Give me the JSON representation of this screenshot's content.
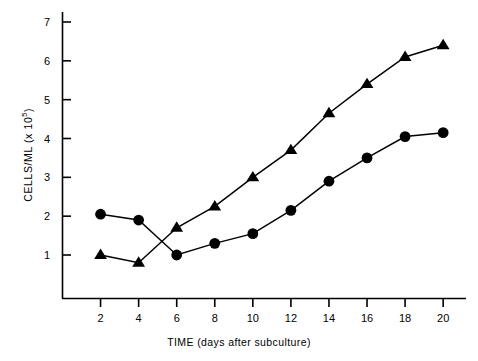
{
  "chart_data": {
    "type": "line",
    "title": "",
    "xlabel": "TIME (days after subculture)",
    "ylabel": "CELLS/ML (x 10⁵)",
    "ylabel_base": "CELLS/ML (x 10",
    "ylabel_exponent": "5",
    "ylabel_close": ")",
    "x": [
      2,
      4,
      6,
      8,
      10,
      12,
      14,
      16,
      18,
      20
    ],
    "xlim": [
      0,
      21.2
    ],
    "ylim": [
      0,
      7.6
    ],
    "xticks": [
      2,
      4,
      6,
      8,
      10,
      12,
      14,
      16,
      18,
      20
    ],
    "yticks": [
      1,
      2,
      3,
      4,
      5,
      6,
      7
    ],
    "xtick_labels": [
      "2",
      "4",
      "6",
      "8",
      "10",
      "12",
      "14",
      "16",
      "18",
      "20"
    ],
    "ytick_labels": [
      "1",
      "2",
      "3",
      "4",
      "5",
      "6",
      "7"
    ],
    "grid": false,
    "legend": "none",
    "line_color": "#000000",
    "series": [
      {
        "name": "circle-series",
        "marker": "circle",
        "values": [
          2.05,
          1.9,
          1.0,
          1.3,
          1.55,
          2.15,
          2.9,
          3.5,
          4.05,
          4.15
        ]
      },
      {
        "name": "triangle-series",
        "marker": "triangle",
        "values": [
          1.0,
          0.8,
          1.7,
          2.25,
          3.0,
          3.7,
          4.65,
          5.4,
          6.1,
          6.4
        ]
      }
    ]
  }
}
